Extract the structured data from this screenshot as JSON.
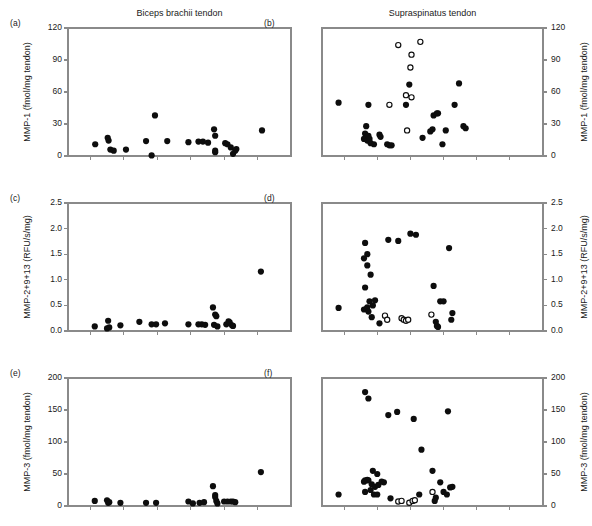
{
  "figure": {
    "width": 592,
    "height": 526,
    "background": "#ffffff",
    "point_color": "#0d0d0d",
    "axis_color": "#8a8a8a",
    "column_titles": {
      "left": "Biceps brachii tendon",
      "right": "Supraspinatus tendon"
    }
  },
  "chart_data": [
    {
      "type": "scatter",
      "panel": "(a)",
      "title": "Biceps brachii tendon",
      "xlabel": "",
      "ylabel": "MMP-1 (fmol/mg tendon)",
      "ylim": [
        0,
        120
      ],
      "yticks": [
        0,
        30,
        60,
        90,
        120
      ],
      "ytick_labels": [
        "0",
        "30",
        "60",
        "90",
        "120"
      ],
      "y_axis_side": "left",
      "xlim": [
        0,
        10
      ],
      "xticks": [
        1,
        2.5,
        4,
        5.5,
        7,
        8.5
      ],
      "xtick_labels": [
        "",
        "",
        "",
        "",
        "",
        ""
      ],
      "grid": false,
      "legend": "none",
      "series": [
        {
          "name": "filled",
          "marker": "filled-circle",
          "points": [
            [
              1.22,
              11
            ],
            [
              1.78,
              17
            ],
            [
              1.82,
              14.5
            ],
            [
              1.9,
              6
            ],
            [
              2.05,
              5
            ],
            [
              2.6,
              6
            ],
            [
              3.5,
              14
            ],
            [
              3.75,
              0.5
            ],
            [
              3.9,
              38
            ],
            [
              4.45,
              14
            ],
            [
              5.4,
              13
            ],
            [
              5.85,
              13.5
            ],
            [
              6.05,
              13.5
            ],
            [
              6.28,
              12.5
            ],
            [
              6.55,
              25
            ],
            [
              6.6,
              19
            ],
            [
              6.6,
              3.5
            ],
            [
              6.6,
              5
            ],
            [
              7.05,
              12
            ],
            [
              7.15,
              11
            ],
            [
              7.3,
              8
            ],
            [
              7.4,
              2
            ],
            [
              7.5,
              5
            ],
            [
              7.55,
              6.5
            ],
            [
              8.7,
              24
            ]
          ]
        }
      ]
    },
    {
      "type": "scatter",
      "panel": "(b)",
      "title": "Supraspinatus tendon",
      "xlabel": "",
      "ylabel": "MMP-1 (fmol/mg tendon)",
      "ylim": [
        0,
        120
      ],
      "yticks": [
        0,
        30,
        60,
        90,
        120
      ],
      "ytick_labels": [
        "0",
        "30",
        "60",
        "90",
        "120"
      ],
      "y_axis_side": "right",
      "xlim": [
        0,
        10
      ],
      "xticks": [
        1,
        2.5,
        4,
        5.5,
        7,
        8.5
      ],
      "xtick_labels": [
        "",
        "",
        "",
        "",
        "",
        ""
      ],
      "grid": false,
      "legend": "none",
      "series": [
        {
          "name": "filled",
          "marker": "filled-circle",
          "points": [
            [
              0.75,
              50
            ],
            [
              2.1,
              48
            ],
            [
              2.0,
              28
            ],
            [
              1.95,
              21
            ],
            [
              1.9,
              16
            ],
            [
              2.0,
              17
            ],
            [
              2.05,
              14.5
            ],
            [
              2.1,
              19
            ],
            [
              2.15,
              16
            ],
            [
              2.2,
              12
            ],
            [
              2.35,
              11
            ],
            [
              2.6,
              20
            ],
            [
              2.65,
              18
            ],
            [
              2.95,
              11
            ],
            [
              3.05,
              10
            ],
            [
              3.15,
              10
            ],
            [
              3.8,
              48
            ],
            [
              3.95,
              67
            ],
            [
              4.55,
              17
            ],
            [
              4.9,
              23
            ],
            [
              5.05,
              38
            ],
            [
              5.2,
              40
            ],
            [
              5.25,
              40
            ],
            [
              5.0,
              25
            ],
            [
              5.45,
              11
            ],
            [
              6.0,
              48
            ],
            [
              6.2,
              68
            ],
            [
              6.4,
              28
            ],
            [
              6.5,
              26
            ],
            [
              5.6,
              24
            ]
          ]
        },
        {
          "name": "open",
          "marker": "open-circle",
          "points": [
            [
              3.45,
              104
            ],
            [
              4.05,
              95
            ],
            [
              4.45,
              107
            ],
            [
              4.0,
              83
            ],
            [
              3.8,
              57
            ],
            [
              4.05,
              55
            ],
            [
              3.05,
              48
            ],
            [
              3.85,
              24
            ]
          ]
        }
      ]
    },
    {
      "type": "scatter",
      "panel": "(c)",
      "title": "",
      "xlabel": "",
      "ylabel": "MMP-2+9+13 (RFU/s/mg)",
      "ylim": [
        0.0,
        2.5
      ],
      "yticks": [
        0.0,
        0.5,
        1.0,
        1.5,
        2.0,
        2.5
      ],
      "ytick_labels": [
        "0.0",
        "0.5",
        "1.0",
        "1.5",
        "2.0",
        "2.5"
      ],
      "y_axis_side": "left",
      "xlim": [
        0,
        10
      ],
      "xticks": [
        1,
        2.5,
        4,
        5.5,
        7,
        8.5
      ],
      "xtick_labels": [
        "",
        "",
        "",
        "",
        "",
        ""
      ],
      "grid": false,
      "legend": "none",
      "series": [
        {
          "name": "filled",
          "marker": "filled-circle",
          "points": [
            [
              1.2,
              0.09
            ],
            [
              1.75,
              0.05
            ],
            [
              1.8,
              0.2
            ],
            [
              1.85,
              0.07
            ],
            [
              2.35,
              0.11
            ],
            [
              3.2,
              0.18
            ],
            [
              3.75,
              0.13
            ],
            [
              3.95,
              0.13
            ],
            [
              4.35,
              0.15
            ],
            [
              5.4,
              0.13
            ],
            [
              5.85,
              0.13
            ],
            [
              6.0,
              0.13
            ],
            [
              6.15,
              0.12
            ],
            [
              6.5,
              0.46
            ],
            [
              6.6,
              0.32
            ],
            [
              6.65,
              0.29
            ],
            [
              6.55,
              0.12
            ],
            [
              6.7,
              0.09
            ],
            [
              7.1,
              0.13
            ],
            [
              7.2,
              0.19
            ],
            [
              7.25,
              0.17
            ],
            [
              7.35,
              0.11
            ],
            [
              7.4,
              0.1
            ],
            [
              8.65,
              1.16
            ]
          ]
        }
      ]
    },
    {
      "type": "scatter",
      "panel": "(d)",
      "title": "",
      "xlabel": "",
      "ylabel": "MMP-2+9+13 (RFU/s/mg)",
      "ylim": [
        0.0,
        2.5
      ],
      "yticks": [
        0.0,
        0.5,
        1.0,
        1.5,
        2.0,
        2.5
      ],
      "ytick_labels": [
        "0.0",
        "0.5",
        "1.0",
        "1.5",
        "2.0",
        "2.5"
      ],
      "y_axis_side": "right",
      "xlim": [
        0,
        10
      ],
      "xticks": [
        1,
        2.5,
        4,
        5.5,
        7,
        8.5
      ],
      "xtick_labels": [
        "",
        "",
        "",
        "",
        "",
        ""
      ],
      "grid": false,
      "legend": "none",
      "series": [
        {
          "name": "filled",
          "marker": "filled-circle",
          "points": [
            [
              0.75,
              0.45
            ],
            [
              1.95,
              1.72
            ],
            [
              2.05,
              1.5
            ],
            [
              1.9,
              1.42
            ],
            [
              2.05,
              1.28
            ],
            [
              2.2,
              1.1
            ],
            [
              1.95,
              0.85
            ],
            [
              2.15,
              0.58
            ],
            [
              2.4,
              0.6
            ],
            [
              2.3,
              0.5
            ],
            [
              1.9,
              0.42
            ],
            [
              2.0,
              0.43
            ],
            [
              2.05,
              0.46
            ],
            [
              2.1,
              0.38
            ],
            [
              2.25,
              0.27
            ],
            [
              2.6,
              0.15
            ],
            [
              3.0,
              1.78
            ],
            [
              3.45,
              1.76
            ],
            [
              4.0,
              1.9
            ],
            [
              4.25,
              1.88
            ],
            [
              5.05,
              0.88
            ],
            [
              5.35,
              0.58
            ],
            [
              5.5,
              0.58
            ],
            [
              5.15,
              0.18
            ],
            [
              5.2,
              0.1
            ],
            [
              5.25,
              0.08
            ],
            [
              5.75,
              1.62
            ],
            [
              5.9,
              0.35
            ],
            [
              5.85,
              0.22
            ]
          ]
        },
        {
          "name": "open",
          "marker": "open-circle",
          "points": [
            [
              2.85,
              0.3
            ],
            [
              2.95,
              0.22
            ],
            [
              3.6,
              0.25
            ],
            [
              3.7,
              0.22
            ],
            [
              3.8,
              0.2
            ],
            [
              3.9,
              0.22
            ],
            [
              4.95,
              0.32
            ]
          ]
        }
      ]
    },
    {
      "type": "scatter",
      "panel": "(e)",
      "title": "",
      "xlabel": "",
      "ylabel": "MMP-3 (fmol/mg tendon)",
      "ylim": [
        0,
        200
      ],
      "yticks": [
        0,
        50,
        100,
        150,
        200
      ],
      "ytick_labels": [
        "0",
        "50",
        "100",
        "150",
        "200"
      ],
      "y_axis_side": "left",
      "xlim": [
        0,
        10
      ],
      "xticks": [
        1,
        2.5,
        4,
        5.5,
        7,
        8.5
      ],
      "xtick_labels": [
        "",
        "",
        "",
        "",
        "",
        ""
      ],
      "grid": false,
      "legend": "none",
      "series": [
        {
          "name": "filled",
          "marker": "filled-circle",
          "points": [
            [
              1.2,
              8
            ],
            [
              1.75,
              9
            ],
            [
              1.8,
              5
            ],
            [
              1.85,
              6
            ],
            [
              2.35,
              5
            ],
            [
              3.5,
              5
            ],
            [
              3.95,
              5
            ],
            [
              5.4,
              7
            ],
            [
              5.6,
              4
            ],
            [
              5.9,
              5
            ],
            [
              6.1,
              6
            ],
            [
              6.5,
              31
            ],
            [
              6.6,
              17
            ],
            [
              6.6,
              14
            ],
            [
              6.65,
              8
            ],
            [
              6.7,
              4
            ],
            [
              7.0,
              7
            ],
            [
              7.15,
              7
            ],
            [
              7.3,
              7
            ],
            [
              7.4,
              7
            ],
            [
              7.5,
              6
            ],
            [
              8.65,
              53
            ]
          ]
        }
      ]
    },
    {
      "type": "scatter",
      "panel": "(f)",
      "title": "",
      "xlabel": "",
      "ylabel": "MMP-3 (fmol/mg tendon)",
      "ylim": [
        0,
        200
      ],
      "yticks": [
        0,
        50,
        100,
        150,
        200
      ],
      "ytick_labels": [
        "0",
        "50",
        "100",
        "150",
        "200"
      ],
      "y_axis_side": "right",
      "xlim": [
        0,
        10
      ],
      "xticks": [
        1,
        2.5,
        4,
        5.5,
        7,
        8.5
      ],
      "xtick_labels": [
        "",
        "",
        "",
        "",
        "",
        ""
      ],
      "grid": false,
      "legend": "none",
      "series": [
        {
          "name": "filled",
          "marker": "filled-circle",
          "points": [
            [
              0.75,
              18
            ],
            [
              1.95,
              178
            ],
            [
              2.1,
              168
            ],
            [
              2.3,
              55
            ],
            [
              2.5,
              50
            ],
            [
              1.95,
              40
            ],
            [
              2.05,
              41
            ],
            [
              2.1,
              40
            ],
            [
              1.9,
              38
            ],
            [
              2.25,
              34
            ],
            [
              2.4,
              30
            ],
            [
              2.55,
              33
            ],
            [
              2.7,
              38
            ],
            [
              2.8,
              37
            ],
            [
              1.95,
              22
            ],
            [
              2.2,
              25
            ],
            [
              2.35,
              18
            ],
            [
              2.5,
              18
            ],
            [
              3.0,
              142
            ],
            [
              3.4,
              147
            ],
            [
              3.1,
              12
            ],
            [
              4.15,
              136
            ],
            [
              4.5,
              88
            ],
            [
              4.4,
              18
            ],
            [
              5.0,
              55
            ],
            [
              5.15,
              13
            ],
            [
              5.1,
              8
            ],
            [
              5.35,
              37
            ],
            [
              5.5,
              22
            ],
            [
              5.65,
              18
            ],
            [
              5.8,
              29
            ],
            [
              5.9,
              30
            ],
            [
              5.7,
              148
            ]
          ]
        },
        {
          "name": "open",
          "marker": "open-circle",
          "points": [
            [
              3.45,
              7
            ],
            [
              3.6,
              8
            ],
            [
              3.95,
              5
            ],
            [
              4.1,
              8
            ],
            [
              4.2,
              9
            ],
            [
              5.0,
              22
            ]
          ]
        }
      ]
    }
  ]
}
